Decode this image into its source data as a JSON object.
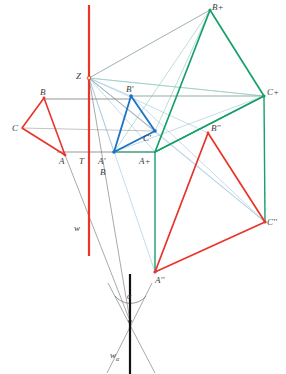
{
  "figure": {
    "canvas": {
      "width": 286,
      "height": 374,
      "background": "#ffffff"
    },
    "colors": {
      "red": "#e8342a",
      "blue": "#1b72c4",
      "green": "#16a06a",
      "gray": "#8a8a8a",
      "light_blue": "#7fb4d6",
      "light_green": "#78bfa4",
      "black": "#111111",
      "label": "#3c3c3c"
    },
    "axis_line": {
      "name": "vertical-axis-w",
      "color": "#e8342a",
      "x": 89,
      "y1": 5,
      "y2": 256,
      "width": 2.2
    },
    "ground_line": {
      "name": "ground-line",
      "y": 152,
      "x1": 57,
      "x2": 156,
      "color": "#8a8a8a"
    },
    "b_ray_line": {
      "name": "b-horizontal-ray",
      "y": 99,
      "x1": 44,
      "x2": 131,
      "color": "#8a8a8a"
    },
    "center": {
      "name": "Z",
      "x": 89,
      "y": 78
    },
    "triangles": [
      {
        "name": "triangle-original-ABC",
        "color": "#e8342a",
        "points": [
          {
            "label": "A",
            "x": 65,
            "y": 155
          },
          {
            "label": "B",
            "x": 44,
            "y": 98
          },
          {
            "label": "C",
            "x": 22,
            "y": 128
          }
        ]
      },
      {
        "name": "triangle-primed-blue",
        "color": "#1b72c4",
        "points": [
          {
            "label": "A'",
            "x": 114,
            "y": 152
          },
          {
            "label": "B'",
            "x": 131,
            "y": 96
          },
          {
            "label": "C'",
            "x": 155,
            "y": 131
          }
        ]
      },
      {
        "name": "triangle-plus-green",
        "color": "#16a06a",
        "points": [
          {
            "label": "A+",
            "x": 155,
            "y": 152
          },
          {
            "label": "B+",
            "x": 210,
            "y": 10
          },
          {
            "label": "C+",
            "x": 264,
            "y": 96
          }
        ]
      },
      {
        "name": "triangle-double-primed-red",
        "color": "#e8342a",
        "points": [
          {
            "label": "A''",
            "x": 155,
            "y": 272
          },
          {
            "label": "B''",
            "x": 208,
            "y": 133
          },
          {
            "label": "C''",
            "x": 265,
            "y": 222
          }
        ]
      }
    ],
    "labels": [
      {
        "name": "label-Z",
        "text": "Z",
        "x": 76,
        "y": 72,
        "size": 9
      },
      {
        "name": "label-B",
        "text": "B",
        "x": 40,
        "y": 88,
        "size": 9
      },
      {
        "name": "label-C",
        "text": "C",
        "x": 12,
        "y": 124,
        "size": 9
      },
      {
        "name": "label-A",
        "text": "A",
        "x": 59,
        "y": 157,
        "size": 9
      },
      {
        "name": "label-T",
        "text": "T",
        "x": 79,
        "y": 157,
        "size": 9
      },
      {
        "name": "label-A-prime",
        "text": "A'",
        "x": 98,
        "y": 157,
        "size": 9
      },
      {
        "name": "label-B-prime",
        "text": "B'",
        "x": 126,
        "y": 85,
        "size": 9
      },
      {
        "name": "label-C-prime",
        "text": "C'",
        "x": 143,
        "y": 134,
        "size": 9
      },
      {
        "name": "label-A-plus",
        "text": "A+",
        "x": 139,
        "y": 157,
        "size": 9
      },
      {
        "name": "label-B-plus",
        "text": "B+",
        "x": 212,
        "y": 3,
        "size": 9
      },
      {
        "name": "label-C-plus",
        "text": "C+",
        "x": 267,
        "y": 88,
        "size": 9
      },
      {
        "name": "label-A-double",
        "text": "A''",
        "x": 155,
        "y": 276,
        "size": 9
      },
      {
        "name": "label-B-double",
        "text": "B''",
        "x": 211,
        "y": 124,
        "size": 9
      },
      {
        "name": "label-C-double",
        "text": "C''",
        "x": 267,
        "y": 218,
        "size": 9
      },
      {
        "name": "label-b-trace",
        "text": "B",
        "x": 100,
        "y": 168,
        "size": 9
      },
      {
        "name": "label-w",
        "text": "w",
        "x": 74,
        "y": 224,
        "size": 9
      }
    ],
    "angle_marker": {
      "name": "angle-alpha",
      "symbol": "α",
      "label_x": 127,
      "label_y": 293,
      "apex_x": 130,
      "apex_y": 321
    },
    "w_alpha_label": {
      "name": "label-w-alpha",
      "text": "w",
      "subscript": "α",
      "x": 110,
      "y": 351
    },
    "bottom_axis": {
      "name": "bottom-black-axis",
      "x": 130,
      "y1": 274,
      "y2": 374,
      "color": "#111111"
    }
  }
}
